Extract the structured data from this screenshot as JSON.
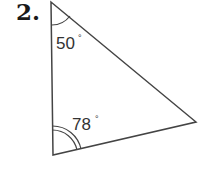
{
  "problem": {
    "number": "2."
  },
  "triangle": {
    "vertices": {
      "top": [
        51,
        2
      ],
      "bottom_left": [
        53,
        155
      ],
      "right": [
        196,
        122
      ]
    },
    "angles": [
      {
        "vertex": "top",
        "value": "50",
        "unit": "°",
        "arcs": 1
      },
      {
        "vertex": "bottom_left",
        "value": "78",
        "unit": "°",
        "arcs": 2
      }
    ],
    "stroke_color": "#444444"
  }
}
